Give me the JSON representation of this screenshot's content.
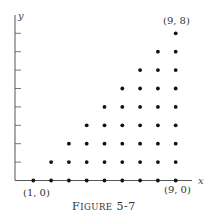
{
  "figure": {
    "caption": "FIGURE 5-7",
    "caption_main": "F",
    "caption_small": "IGURE",
    "caption_num": "5-7"
  },
  "axes": {
    "x_label": "x",
    "y_label": "y",
    "y_ticks": 8
  },
  "annotations": {
    "bottom_left": "(1, 0)",
    "bottom_right": "(9, 0)",
    "top_right": "(9, 8)"
  },
  "colors": {
    "axis": "#555555",
    "point": "#111111",
    "text": "#333333"
  },
  "chart_data": {
    "type": "scatter",
    "xlabel": "x",
    "ylabel": "y",
    "points": [
      [
        1,
        0
      ],
      [
        2,
        0
      ],
      [
        2,
        1
      ],
      [
        3,
        0
      ],
      [
        3,
        1
      ],
      [
        3,
        2
      ],
      [
        4,
        0
      ],
      [
        4,
        1
      ],
      [
        4,
        2
      ],
      [
        4,
        3
      ],
      [
        5,
        0
      ],
      [
        5,
        1
      ],
      [
        5,
        2
      ],
      [
        5,
        3
      ],
      [
        5,
        4
      ],
      [
        6,
        0
      ],
      [
        6,
        1
      ],
      [
        6,
        2
      ],
      [
        6,
        3
      ],
      [
        6,
        4
      ],
      [
        6,
        5
      ],
      [
        7,
        0
      ],
      [
        7,
        1
      ],
      [
        7,
        2
      ],
      [
        7,
        3
      ],
      [
        7,
        4
      ],
      [
        7,
        5
      ],
      [
        7,
        6
      ],
      [
        8,
        0
      ],
      [
        8,
        1
      ],
      [
        8,
        2
      ],
      [
        8,
        3
      ],
      [
        8,
        4
      ],
      [
        8,
        5
      ],
      [
        8,
        6
      ],
      [
        8,
        7
      ],
      [
        9,
        0
      ],
      [
        9,
        1
      ],
      [
        9,
        2
      ],
      [
        9,
        3
      ],
      [
        9,
        4
      ],
      [
        9,
        5
      ],
      [
        9,
        6
      ],
      [
        9,
        7
      ],
      [
        9,
        8
      ]
    ],
    "grid": false,
    "xlim": [
      0,
      10
    ],
    "ylim": [
      0,
      8.5
    ]
  }
}
